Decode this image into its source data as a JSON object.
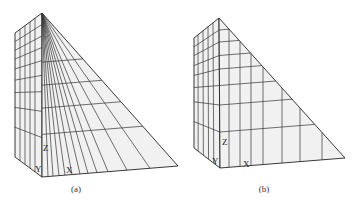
{
  "figures": [
    {
      "id": "a",
      "caption": "(a)",
      "caption_pos": [
        76,
        192
      ],
      "style": "radial",
      "points": {
        "apex": [
          42,
          13
        ],
        "left_top": [
          15,
          33
        ],
        "left_bottom": [
          15,
          157
        ],
        "front_bottom": [
          42,
          177
        ],
        "right_bottom": [
          178,
          166
        ]
      },
      "side_columns": [
        20,
        25,
        30,
        35
      ],
      "side_rows": [
        0.07,
        0.14,
        0.21,
        0.29,
        0.38,
        0.48,
        0.6,
        0.76
      ],
      "front_fan_bottom_x": [
        48,
        53,
        59,
        65,
        72,
        80,
        88,
        97,
        108,
        127,
        150
      ],
      "front_rows": [
        0.3,
        0.44,
        0.58,
        0.74
      ],
      "labels": {
        "z": {
          "text": "Z",
          "pos": [
            43,
            151
          ]
        },
        "y": {
          "text": "Y",
          "pos": [
            35,
            172
          ]
        },
        "x": {
          "text": "X",
          "pos": [
            66,
            173
          ]
        }
      }
    },
    {
      "id": "b",
      "caption": "(b)",
      "caption_pos": [
        264,
        192
      ],
      "style": "rectilinear",
      "points": {
        "apex": [
          219,
          18
        ],
        "left_top": [
          194,
          38
        ],
        "left_bottom": [
          194,
          148
        ],
        "front_bottom": [
          220,
          168
        ],
        "right_bottom": [
          345,
          158
        ]
      },
      "side_columns": [
        198,
        203,
        208,
        213
      ],
      "side_rows": [
        0.08,
        0.16,
        0.25,
        0.34,
        0.45,
        0.58,
        0.76
      ],
      "front_cols_x": [
        229,
        240,
        251,
        263,
        282,
        300,
        322
      ],
      "front_rows": [
        0.08,
        0.16,
        0.25,
        0.34,
        0.45,
        0.58,
        0.76
      ],
      "labels": {
        "z": {
          "text": "Z",
          "pos": [
            222,
            145
          ]
        },
        "y": {
          "text": "Y",
          "pos": [
            212,
            164
          ]
        },
        "x": {
          "text": "X",
          "pos": [
            243,
            167
          ]
        }
      }
    }
  ]
}
